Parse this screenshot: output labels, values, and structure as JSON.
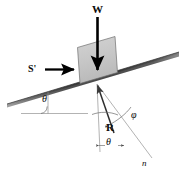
{
  "figure": {
    "background_color": "#ffffff",
    "width": 185,
    "height": 180
  },
  "labels": {
    "weight": "W",
    "applied_force": "S'",
    "incline_angle": "θ",
    "reaction": "R",
    "friction_angle": "φ",
    "normal_angle": "θ",
    "normal_line": "n"
  },
  "colors": {
    "incline_dark": "#3a3a3a",
    "incline_light": "#8e8e8e",
    "block_fill": "#c6c6c6",
    "block_stroke": "#6e6e6e",
    "arrow": "#000000",
    "construction_line": "#7a7a7a",
    "text": "#0b0b0b"
  },
  "geometry": {
    "incline_left": [
      7,
      104
    ],
    "incline_right": [
      179,
      52
    ],
    "block_contact": [
      97,
      84
    ],
    "weight_arrow_from": [
      97,
      17
    ],
    "weight_arrow_to": [
      97,
      74
    ],
    "applied_arrow_from": [
      45,
      69
    ],
    "applied_arrow_to": [
      76,
      69
    ],
    "reaction_tail": [
      113,
      132
    ],
    "reaction_head": [
      97,
      84
    ],
    "vertical_ref_top": [
      97,
      84
    ],
    "vertical_ref_bottom": [
      99,
      152
    ],
    "normal_far": [
      152,
      158
    ],
    "horizontal_ref_left": [
      22,
      113
    ],
    "horizontal_ref_right": [
      86,
      113
    ]
  }
}
